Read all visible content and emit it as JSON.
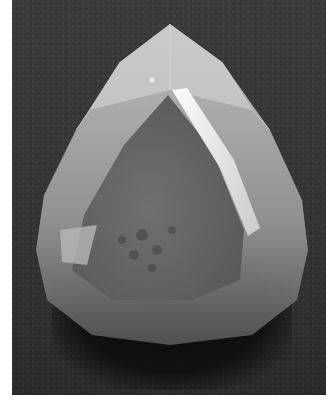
{
  "image": {
    "description": "Grayscale photograph of a pear/drop-shaped faceted gemstone on a dark textured background",
    "subject": "faceted gemstone",
    "style": "black-and-white photograph",
    "colors": {
      "background": "#333333",
      "stone_light": "#d8d8d8",
      "stone_mid": "#9a9a9a",
      "stone_dark": "#5a5a5a",
      "highlight": "#f2f2f2",
      "shadow": "#0a0a0a",
      "margin": "#ffffff"
    }
  }
}
